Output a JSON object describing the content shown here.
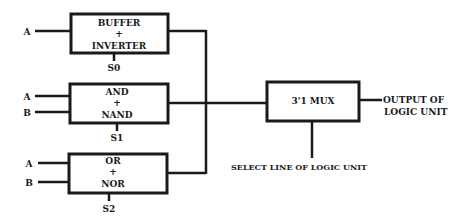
{
  "diagram": {
    "type": "block-diagram",
    "title": "Logic Unit",
    "colors": {
      "stroke": "#1a1a1a",
      "background": "#ffffff"
    },
    "blocks": [
      {
        "id": "block-buffer-inverter",
        "line1": "BUFFER",
        "line2": "+",
        "line3": "INVERTER",
        "inputs": [
          "A"
        ],
        "select": "S0"
      },
      {
        "id": "block-and-nand",
        "line1": "AND",
        "line2": "+",
        "line3": "NAND",
        "inputs": [
          "A",
          "B"
        ],
        "select": "S1"
      },
      {
        "id": "block-or-nor",
        "line1": "OR",
        "line2": "+",
        "line3": "NOR",
        "inputs": [
          "A",
          "B"
        ],
        "select": "S2"
      }
    ],
    "mux": {
      "label": "3'1 MUX",
      "output_line1": "OUTPUT OF",
      "output_line2": "LOGIC UNIT",
      "select_label": "SELECT LINE OF LOGIC UNIT"
    }
  }
}
